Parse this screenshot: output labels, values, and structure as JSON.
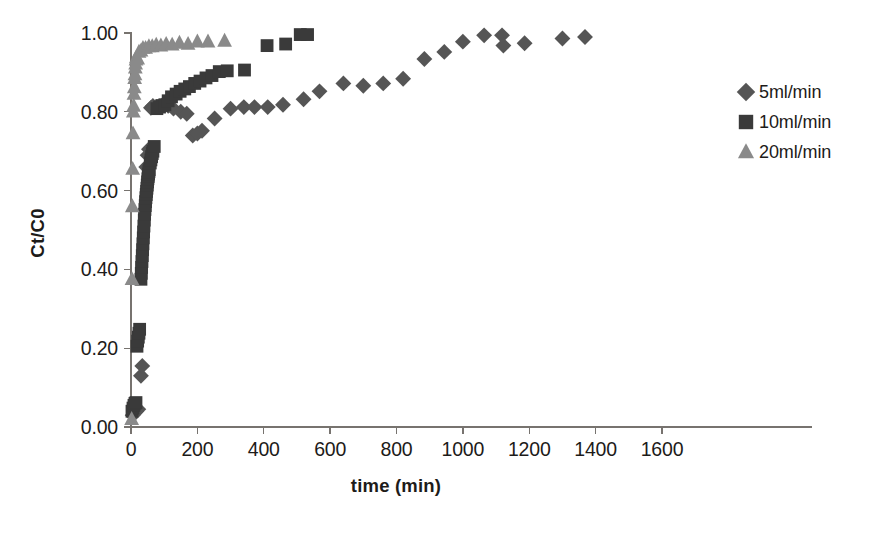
{
  "chart_data": {
    "type": "scatter",
    "title": "",
    "xlabel": "time  (min)",
    "ylabel": "Ct/C0",
    "xlim": [
      0,
      1600
    ],
    "ylim": [
      0.0,
      1.0
    ],
    "xticks": [
      0,
      200,
      400,
      600,
      800,
      1000,
      1200,
      1400,
      1600
    ],
    "xtick_labels": [
      "0",
      "200",
      "400",
      "600",
      "800",
      "1000",
      "1200",
      "1400",
      "1600"
    ],
    "yticks": [
      0.0,
      0.2,
      0.4,
      0.6,
      0.8,
      1.0
    ],
    "ytick_labels": [
      "0.00",
      "0.20",
      "0.40",
      "0.60",
      "0.80",
      "1.00"
    ],
    "grid": false,
    "legend_position": "right",
    "series": [
      {
        "name": "5ml/min",
        "marker": "diamond",
        "color": "#555555",
        "points": [
          [
            5,
            0.03
          ],
          [
            10,
            0.035
          ],
          [
            16,
            0.04
          ],
          [
            22,
            0.045
          ],
          [
            30,
            0.13
          ],
          [
            34,
            0.155
          ],
          [
            46,
            0.66
          ],
          [
            50,
            0.69
          ],
          [
            54,
            0.705
          ],
          [
            60,
            0.81
          ],
          [
            66,
            0.815
          ],
          [
            74,
            0.812
          ],
          [
            96,
            0.818
          ],
          [
            112,
            0.815
          ],
          [
            128,
            0.808
          ],
          [
            150,
            0.8
          ],
          [
            168,
            0.795
          ],
          [
            186,
            0.74
          ],
          [
            200,
            0.745
          ],
          [
            214,
            0.752
          ],
          [
            252,
            0.783
          ],
          [
            300,
            0.808
          ],
          [
            340,
            0.812
          ],
          [
            372,
            0.812
          ],
          [
            412,
            0.812
          ],
          [
            458,
            0.818
          ],
          [
            520,
            0.832
          ],
          [
            568,
            0.852
          ],
          [
            640,
            0.872
          ],
          [
            700,
            0.866
          ],
          [
            760,
            0.872
          ],
          [
            820,
            0.884
          ],
          [
            884,
            0.934
          ],
          [
            944,
            0.952
          ],
          [
            1000,
            0.978
          ],
          [
            1064,
            0.994
          ],
          [
            1118,
            0.994
          ],
          [
            1122,
            0.968
          ],
          [
            1186,
            0.974
          ],
          [
            1300,
            0.986
          ],
          [
            1368,
            0.99
          ]
        ]
      },
      {
        "name": "10ml/min",
        "marker": "square",
        "color": "#3a3a3a",
        "points": [
          [
            3,
            0.04
          ],
          [
            6,
            0.048
          ],
          [
            9,
            0.055
          ],
          [
            12,
            0.06
          ],
          [
            15,
            0.062
          ],
          [
            18,
            0.205
          ],
          [
            20,
            0.218
          ],
          [
            22,
            0.228
          ],
          [
            24,
            0.238
          ],
          [
            26,
            0.248
          ],
          [
            30,
            0.375
          ],
          [
            31,
            0.39
          ],
          [
            32,
            0.405
          ],
          [
            33,
            0.42
          ],
          [
            34,
            0.435
          ],
          [
            35,
            0.45
          ],
          [
            36,
            0.465
          ],
          [
            37,
            0.48
          ],
          [
            38,
            0.495
          ],
          [
            39,
            0.51
          ],
          [
            40,
            0.525
          ],
          [
            41,
            0.54
          ],
          [
            42,
            0.552
          ],
          [
            43,
            0.562
          ],
          [
            44,
            0.572
          ],
          [
            45,
            0.582
          ],
          [
            46,
            0.59
          ],
          [
            47,
            0.598
          ],
          [
            48,
            0.606
          ],
          [
            49,
            0.614
          ],
          [
            50,
            0.622
          ],
          [
            51,
            0.63
          ],
          [
            52,
            0.636
          ],
          [
            53,
            0.642
          ],
          [
            54,
            0.648
          ],
          [
            55,
            0.653
          ],
          [
            58,
            0.67
          ],
          [
            60,
            0.678
          ],
          [
            62,
            0.686
          ],
          [
            64,
            0.694
          ],
          [
            66,
            0.7
          ],
          [
            70,
            0.712
          ],
          [
            78,
            0.808
          ],
          [
            86,
            0.812
          ],
          [
            94,
            0.816
          ],
          [
            102,
            0.818
          ],
          [
            112,
            0.828
          ],
          [
            122,
            0.838
          ],
          [
            136,
            0.845
          ],
          [
            148,
            0.852
          ],
          [
            162,
            0.858
          ],
          [
            176,
            0.864
          ],
          [
            192,
            0.872
          ],
          [
            208,
            0.878
          ],
          [
            226,
            0.886
          ],
          [
            244,
            0.892
          ],
          [
            266,
            0.902
          ],
          [
            290,
            0.904
          ],
          [
            342,
            0.906
          ],
          [
            410,
            0.968
          ],
          [
            466,
            0.972
          ],
          [
            510,
            0.996
          ],
          [
            532,
            0.996
          ]
        ]
      },
      {
        "name": "20ml/min",
        "marker": "triangle",
        "color": "#8a8a8a",
        "points": [
          [
            2,
            0.02
          ],
          [
            3,
            0.375
          ],
          [
            4,
            0.56
          ],
          [
            5,
            0.655
          ],
          [
            6,
            0.745
          ],
          [
            7,
            0.8
          ],
          [
            8,
            0.815
          ],
          [
            9,
            0.845
          ],
          [
            10,
            0.862
          ],
          [
            11,
            0.885
          ],
          [
            12,
            0.895
          ],
          [
            13,
            0.912
          ],
          [
            14,
            0.922
          ],
          [
            15,
            0.932
          ],
          [
            16,
            0.938
          ],
          [
            20,
            0.935
          ],
          [
            24,
            0.952
          ],
          [
            30,
            0.955
          ],
          [
            36,
            0.962
          ],
          [
            44,
            0.962
          ],
          [
            54,
            0.966
          ],
          [
            64,
            0.966
          ],
          [
            76,
            0.97
          ],
          [
            90,
            0.968
          ],
          [
            106,
            0.972
          ],
          [
            124,
            0.97
          ],
          [
            146,
            0.975
          ],
          [
            172,
            0.972
          ],
          [
            200,
            0.978
          ],
          [
            232,
            0.978
          ],
          [
            282,
            0.98
          ]
        ]
      }
    ]
  },
  "legend": {
    "entries": [
      {
        "label": "5ml/min",
        "marker": "diamond",
        "color": "#555555"
      },
      {
        "label": "10ml/min",
        "marker": "square",
        "color": "#3a3a3a"
      },
      {
        "label": "20ml/min",
        "marker": "triangle",
        "color": "#8a8a8a"
      }
    ]
  }
}
